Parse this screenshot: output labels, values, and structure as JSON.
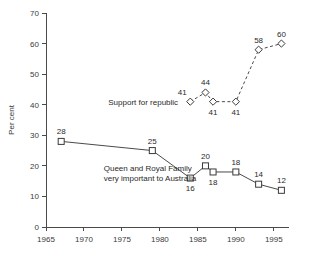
{
  "chart_data": {
    "type": "line",
    "title": "",
    "xlabel": "",
    "ylabel": "Per cent",
    "xlim": [
      1965,
      1997
    ],
    "ylim": [
      0,
      70
    ],
    "xticks": [
      1965,
      1970,
      1975,
      1980,
      1985,
      1990,
      1995
    ],
    "yticks": [
      0,
      10,
      20,
      30,
      40,
      50,
      60,
      70
    ],
    "grid": false,
    "legend": "none",
    "series": [
      {
        "name": "Support for republic",
        "marker": "diamond",
        "linestyle": "dashed",
        "x": [
          1984,
          1986,
          1987,
          1990,
          1993,
          1996
        ],
        "values": [
          41,
          44,
          41,
          41,
          58,
          60
        ],
        "labels": [
          "41",
          "44",
          "41",
          "41",
          "58",
          "60"
        ],
        "label_positions": [
          "above-left",
          "above",
          "below",
          "below",
          "above",
          "above"
        ]
      },
      {
        "name": "Queen and Royal Family very important to Australia",
        "marker": "square",
        "linestyle": "solid",
        "x": [
          1967,
          1979,
          1984,
          1986,
          1987,
          1990,
          1993,
          1996
        ],
        "values": [
          28,
          25,
          16,
          20,
          18,
          18,
          14,
          12
        ],
        "labels": [
          "28",
          "25",
          "16",
          "20",
          "18",
          "18",
          "14",
          "12"
        ],
        "label_positions": [
          "above",
          "above",
          "below",
          "above",
          "below",
          "above",
          "above",
          "above"
        ]
      }
    ],
    "annotations": [
      {
        "id": "republic-annotation",
        "lines": [
          "Support for republic"
        ],
        "x": 1973.2,
        "y": 40.0
      },
      {
        "id": "monarchy-annotation",
        "lines": [
          "Queen and Royal Family",
          "very important to Australia"
        ],
        "x": 1972.6,
        "y": 18.2
      }
    ],
    "colors": {
      "axis": "#4a4a4a",
      "line": "#4a4a4a",
      "marker_fill": "#ffffff",
      "marker_stroke": "#3a3a3a",
      "text": "#2a2a2a",
      "background": "#ffffff"
    }
  }
}
